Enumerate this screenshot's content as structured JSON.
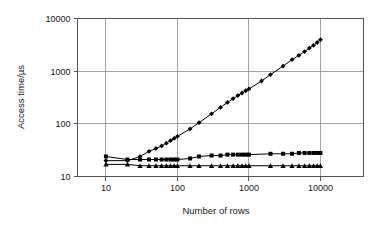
{
  "chart_data": {
    "type": "line",
    "title": "",
    "subtitle": "",
    "xlabel": "Number of rows",
    "ylabel": "Access time/µs",
    "xscale": "log",
    "yscale": "log",
    "xlim": [
      4,
      40000
    ],
    "ylim": [
      10,
      10000
    ],
    "xticks": [
      10,
      100,
      1000,
      10000
    ],
    "xtick_labels": [
      "10",
      "100",
      "1000",
      "10000"
    ],
    "yticks": [
      10,
      100,
      1000,
      10000
    ],
    "ytick_labels": [
      "10",
      "100",
      "1000",
      "10000"
    ],
    "grid": true,
    "grid_color": "#8d8d8d",
    "legend": "none",
    "series": [
      {
        "name": "series-rising",
        "marker": "diamond",
        "color": "#000000",
        "x": [
          10,
          20,
          30,
          40,
          50,
          60,
          70,
          80,
          90,
          100,
          150,
          200,
          300,
          400,
          500,
          600,
          700,
          800,
          900,
          1000,
          1500,
          2000,
          3000,
          4000,
          5000,
          6000,
          7000,
          8000,
          9000,
          10000
        ],
        "y": [
          20,
          20,
          24,
          30,
          34,
          38,
          43,
          48,
          53,
          58,
          80,
          105,
          155,
          205,
          255,
          300,
          345,
          385,
          425,
          460,
          650,
          860,
          1250,
          1650,
          2000,
          2350,
          2750,
          3100,
          3500,
          3950
        ]
      },
      {
        "name": "series-squares",
        "marker": "square",
        "color": "#000000",
        "x": [
          10,
          20,
          30,
          40,
          50,
          60,
          70,
          80,
          90,
          100,
          150,
          200,
          300,
          400,
          500,
          600,
          700,
          800,
          900,
          1000,
          2000,
          3000,
          4000,
          5000,
          6000,
          7000,
          8000,
          9000,
          10000
        ],
        "y": [
          24,
          21,
          21,
          21,
          21,
          21,
          21,
          21,
          21,
          21,
          22,
          24,
          25,
          25,
          26,
          26,
          26,
          26,
          26,
          26,
          27,
          27,
          27,
          28,
          28,
          28,
          28,
          28,
          28
        ]
      },
      {
        "name": "series-triangles",
        "marker": "triangle",
        "color": "#000000",
        "x": [
          10,
          20,
          30,
          40,
          50,
          60,
          70,
          80,
          90,
          100,
          150,
          200,
          300,
          400,
          500,
          600,
          700,
          800,
          900,
          1000,
          2000,
          3000,
          4000,
          5000,
          6000,
          7000,
          8000,
          9000,
          10000
        ],
        "y": [
          17,
          17,
          16,
          16,
          16,
          16,
          16,
          16,
          16,
          16,
          16,
          16,
          16,
          16,
          16,
          16,
          16,
          16,
          16,
          16,
          16,
          16,
          16,
          16,
          16,
          16,
          16,
          16,
          16
        ]
      }
    ]
  }
}
